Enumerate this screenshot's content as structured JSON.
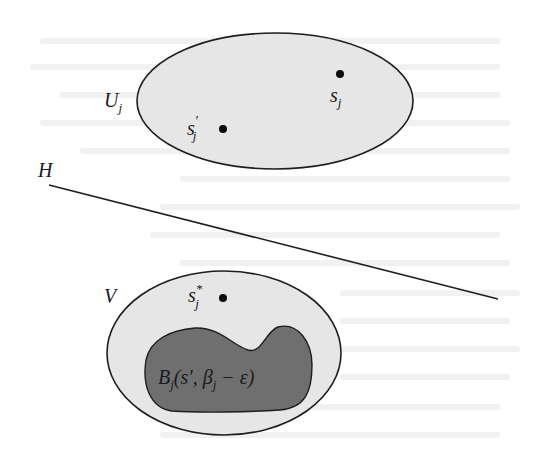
{
  "diagram": {
    "colors": {
      "background": "#ffffff",
      "light_region_fill": "#e6e6e6",
      "dark_region_fill": "#6f6f6f",
      "stroke": "#1e1e1e",
      "point": "#0a0a0a"
    },
    "regions": {
      "U": {
        "label": "U",
        "subscript": "j"
      },
      "V": {
        "label": "V"
      },
      "B": {
        "label_main": "B",
        "label_sub": "j",
        "label_args": "(s′, β",
        "label_args_sub": "j",
        "label_tail": " − ε)"
      }
    },
    "points": {
      "s_j": {
        "label": "s",
        "subscript": "j"
      },
      "s_prime_j": {
        "label": "s",
        "prime": "′",
        "subscript": "j"
      },
      "s_star_j": {
        "label": "s",
        "superscript": "*",
        "subscript": "j"
      }
    },
    "hyperplane": {
      "label": "H"
    }
  }
}
